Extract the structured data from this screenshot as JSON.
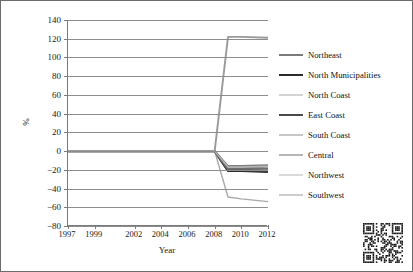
{
  "figure": {
    "ylabel": "%",
    "xlabel": "Year",
    "qr_name": "qr-code"
  },
  "chart_data": {
    "type": "line",
    "title": "",
    "subtitle": "",
    "xlabel": "Year",
    "ylabel": "%",
    "x": [
      1997,
      1999,
      2002,
      2004,
      2006,
      2008,
      2009,
      2010,
      2012
    ],
    "xtick_labels": [
      "1997",
      "1999",
      "2002",
      "2004",
      "2006",
      "2008",
      "2010",
      "2012"
    ],
    "xtick_values": [
      1997,
      1999,
      2002,
      2004,
      2006,
      2008,
      2010,
      2012
    ],
    "ytick_labels": [
      "140",
      "120",
      "100",
      "80",
      "60",
      "40",
      "20",
      "0",
      "-20",
      "-40",
      "-60",
      "-80"
    ],
    "ytick_values": [
      140,
      120,
      100,
      80,
      60,
      40,
      20,
      0,
      -20,
      -40,
      -60,
      -80
    ],
    "ylim": [
      -80,
      140
    ],
    "xlim": [
      1997,
      2012
    ],
    "grid": "horizontal",
    "legend_position": "right",
    "series": [
      {
        "name": "Northeast",
        "color": "#7c7c7c",
        "width": 2.0,
        "values": [
          0,
          0,
          0,
          0,
          0,
          0,
          -16,
          -16,
          -15
        ]
      },
      {
        "name": "North Municipalities",
        "color": "#2b2b2b",
        "width": 2.4,
        "values": [
          0,
          0,
          0,
          0,
          0,
          0,
          -21,
          -21,
          -22
        ]
      },
      {
        "name": "North Coast",
        "color": "#a8a8a8",
        "width": 1.4,
        "values": [
          0,
          0,
          0,
          0,
          0,
          0,
          -49,
          -51,
          -54
        ]
      },
      {
        "name": "East Coast",
        "color": "#4a4a4a",
        "width": 2.2,
        "values": [
          0,
          0,
          0,
          0,
          0,
          0,
          -20,
          -20,
          -21
        ]
      },
      {
        "name": "South Coast",
        "color": "#8f8f8f",
        "width": 1.6,
        "values": [
          0,
          0,
          0,
          0,
          0,
          0,
          -18,
          -18,
          -17
        ]
      },
      {
        "name": "Central",
        "color": "#6e6e6e",
        "width": 1.8,
        "values": [
          0,
          0,
          0,
          0,
          0,
          0,
          -19,
          -19,
          -19
        ]
      },
      {
        "name": "Northwest",
        "color": "#b5b5b5",
        "width": 1.3,
        "values": [
          0,
          0,
          0,
          0,
          0,
          0,
          -17,
          -17,
          -16
        ]
      },
      {
        "name": "Southwest",
        "color": "#9a9a9a",
        "width": 1.9,
        "values": [
          0,
          0,
          0,
          0,
          0,
          0,
          122,
          122,
          121
        ]
      }
    ]
  }
}
